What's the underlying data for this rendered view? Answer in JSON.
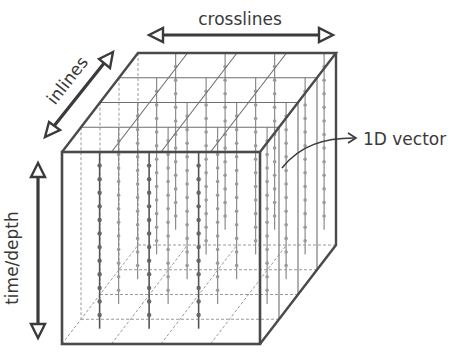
{
  "diagram": {
    "type": "seismic-data-cube",
    "labels": {
      "crosslines": "crosslines",
      "inlines": "inlines",
      "time_depth": "time/depth",
      "vector": "1D vector"
    },
    "icons": {
      "crosslines_arrow": "double-headed-arrow-horizontal",
      "inlines_arrow": "double-headed-arrow-diagonal",
      "time_depth_arrow": "double-headed-arrow-vertical",
      "vector_pointer": "curved-arrow-right"
    },
    "colors": {
      "line": "#4a4a4a",
      "grid": "#6e6e6e",
      "hidden": "#9a9a9a",
      "text": "#3a3a3a",
      "background": "#ffffff"
    },
    "grid": {
      "crossline_divisions": 4,
      "inline_divisions": 4,
      "samples_per_trace": 12
    }
  }
}
